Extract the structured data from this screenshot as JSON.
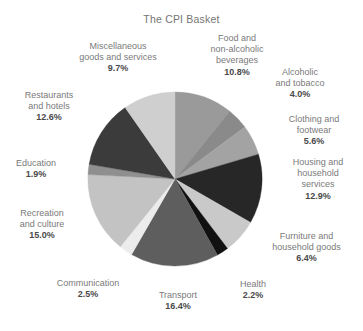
{
  "chart_data": {
    "type": "pie",
    "title": "The CPI Basket",
    "xlabel": "",
    "ylabel": "",
    "legend_position": "none",
    "grid": false,
    "start_angle_deg": 0,
    "direction": "clockwise",
    "categories": [
      "Food and non-alcoholic beverages",
      "Alcoholic and tobacco",
      "Clothing and footwear",
      "Housing and household services",
      "Furniture and household goods",
      "Health",
      "Transport",
      "Communication",
      "Recreation and culture",
      "Education",
      "Restaurants and hotels",
      "Miscellaneous goods and services"
    ],
    "values": [
      10.8,
      4.0,
      5.6,
      12.9,
      6.4,
      2.2,
      16.4,
      2.5,
      15.0,
      1.9,
      12.6,
      9.7
    ],
    "value_labels": [
      "10.8%",
      "4.0%",
      "5.6%",
      "12.9%",
      "6.4%",
      "2.2%",
      "16.4%",
      "2.5%",
      "15.0%",
      "1.9%",
      "12.6%",
      "9.7%"
    ],
    "colors": [
      "#9a9a9a",
      "#8a8a8a",
      "#a3a3a3",
      "#272727",
      "#c9c9c9",
      "#111111",
      "#5e5e5e",
      "#ececec",
      "#c3c3c3",
      "#8f8f8f",
      "#3b3b3b",
      "#cfcfcf"
    ],
    "units": "percent",
    "total": 100.0
  },
  "labels": {
    "food": {
      "name_line1": "Food and",
      "name_line2": "non-alcoholic",
      "name_line3": "beverages",
      "value": "10.8%"
    },
    "alcoholic": {
      "name_line1": "Alcoholic",
      "name_line2": "and tobacco",
      "value": "4.0%"
    },
    "clothing": {
      "name_line1": "Clothing and",
      "name_line2": "footwear",
      "value": "5.6%"
    },
    "housing": {
      "name_line1": "Housing and",
      "name_line2": "household",
      "name_line3": "services",
      "value": "12.9%"
    },
    "furniture": {
      "name_line1": "Furniture and",
      "name_line2": "household goods",
      "value": "6.4%"
    },
    "health": {
      "name_line1": "Health",
      "value": "2.2%"
    },
    "transport": {
      "name_line1": "Transport",
      "value": "16.4%"
    },
    "communication": {
      "name_line1": "Communication",
      "value": "2.5%"
    },
    "recreation": {
      "name_line1": "Recreation",
      "name_line2": "and culture",
      "value": "15.0%"
    },
    "education": {
      "name_line1": "Education",
      "value": "1.9%"
    },
    "restaurants": {
      "name_line1": "Restaurants",
      "name_line2": "and hotels",
      "value": "12.6%"
    },
    "miscellaneous": {
      "name_line1": "Miscellaneous",
      "name_line2": "goods and services",
      "value": "9.7%"
    }
  },
  "style": {
    "background": "#ffffff",
    "title_color": "#757575",
    "label_color": "#7a7a7a",
    "value_color": "#4a4a4a"
  }
}
